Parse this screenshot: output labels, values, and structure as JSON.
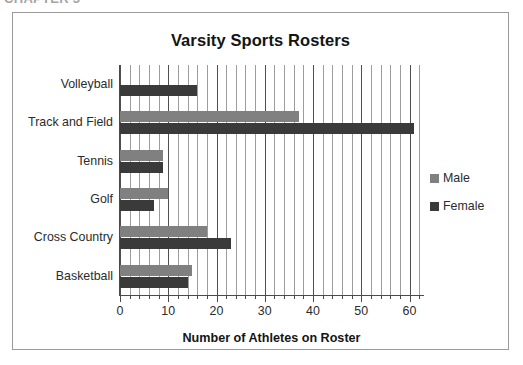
{
  "top_fragment": "CHAPTER 3",
  "chart": {
    "title": "Varsity Sports Rosters",
    "x_axis_title": "Number of Athletes on Roster",
    "legend": {
      "items": [
        {
          "label": "Male",
          "color": "#808080"
        },
        {
          "label": "Female",
          "color": "#3a3a3a"
        }
      ]
    }
  },
  "chart_data": {
    "type": "bar",
    "orientation": "horizontal",
    "title": "Varsity Sports Rosters",
    "xlabel": "Number of Athletes on Roster",
    "ylabel": "",
    "categories": [
      "Volleyball",
      "Track and Field",
      "Tennis",
      "Golf",
      "Cross Country",
      "Basketball"
    ],
    "series": [
      {
        "name": "Male",
        "color": "#808080",
        "values": [
          0,
          37,
          9,
          10,
          18,
          15
        ]
      },
      {
        "name": "Female",
        "color": "#3a3a3a",
        "values": [
          16,
          61,
          9,
          7,
          23,
          14
        ]
      }
    ],
    "xlim": [
      0,
      63
    ],
    "xticks": [
      0,
      10,
      20,
      30,
      40,
      50,
      60
    ],
    "xtick_labels": [
      "0",
      "10",
      "20",
      "30",
      "40",
      "50",
      "60"
    ],
    "minor_gridline_interval": 2,
    "grid": true,
    "grid_axis": "x",
    "legend_position": "right"
  }
}
